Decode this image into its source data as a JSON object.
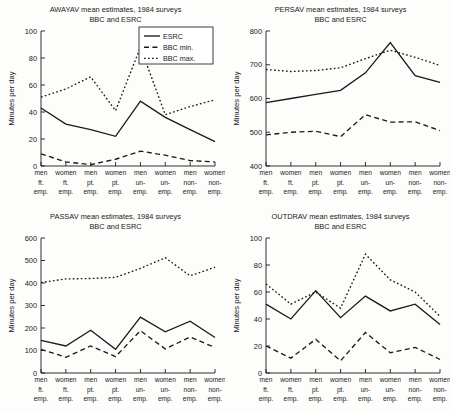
{
  "figure": {
    "width": 450,
    "height": 413,
    "background": "#fdfdfb",
    "ink_color": "#1a1a1a"
  },
  "shared": {
    "categories": [
      "men ft. emp.",
      "women ft. emp.",
      "men pt. emp.",
      "women pt. emp.",
      "men un- emp.",
      "women un- emp.",
      "men non- emp.",
      "women non- emp."
    ],
    "category_lines": [
      [
        "men",
        "ft.",
        "emp."
      ],
      [
        "women",
        "ft.",
        "emp."
      ],
      [
        "men",
        "pt.",
        "emp."
      ],
      [
        "women",
        "pt.",
        "emp."
      ],
      [
        "men",
        "un-",
        "emp."
      ],
      [
        "women",
        "un-",
        "emp."
      ],
      [
        "men",
        "non-",
        "emp."
      ],
      [
        "women",
        "non-",
        "emp."
      ]
    ],
    "ylabel": "Minutes per day",
    "title_line2": "BBC and ESRC",
    "legend": [
      {
        "label": "ESRC",
        "style": "solid"
      },
      {
        "label": "BBC min.",
        "style": "dashed"
      },
      {
        "label": "BBC max.",
        "style": "dotted"
      }
    ]
  },
  "chart_data": [
    {
      "id": "awayav",
      "type": "line",
      "title": "AWAYAV mean estimates, 1984 surveys",
      "subtitle": "BBC and ESRC",
      "xlabel": "",
      "ylabel": "Minutes per day",
      "ylim": [
        0,
        100
      ],
      "yticks": [
        0,
        20,
        40,
        60,
        80,
        100
      ],
      "grid": false,
      "legend_position": "top-right",
      "categories": [
        "men ft. emp.",
        "women ft. emp.",
        "men pt. emp.",
        "women pt. emp.",
        "men un- emp.",
        "women un- emp.",
        "men non- emp.",
        "women non- emp."
      ],
      "series": [
        {
          "name": "ESRC",
          "style": "solid",
          "values": [
            43,
            31,
            27,
            22,
            48,
            36,
            27,
            18
          ]
        },
        {
          "name": "BBC min.",
          "style": "dashed",
          "values": [
            9,
            3,
            1,
            5,
            11,
            8,
            4,
            3
          ]
        },
        {
          "name": "BBC max.",
          "style": "dotted",
          "values": [
            51,
            57,
            66,
            41,
            88,
            38,
            44,
            49
          ]
        }
      ]
    },
    {
      "id": "persav",
      "type": "line",
      "title": "PERSAV mean estimates, 1984 surveys",
      "subtitle": "BBC and ESRC",
      "xlabel": "",
      "ylabel": "Minutes per day",
      "ylim": [
        400,
        800
      ],
      "yticks": [
        400,
        500,
        600,
        700,
        800
      ],
      "grid": false,
      "legend_position": "none",
      "categories": [
        "men ft. emp.",
        "women ft. emp.",
        "men pt. emp.",
        "women pt. emp.",
        "men un- emp.",
        "women un- emp.",
        "men non- emp.",
        "women non- emp."
      ],
      "series": [
        {
          "name": "ESRC",
          "style": "solid",
          "values": [
            588,
            600,
            612,
            624,
            676,
            766,
            668,
            648
          ]
        },
        {
          "name": "BBC min.",
          "style": "dashed",
          "values": [
            492,
            500,
            503,
            487,
            552,
            530,
            531,
            505
          ]
        },
        {
          "name": "BBC max.",
          "style": "dotted",
          "values": [
            686,
            680,
            683,
            691,
            718,
            743,
            722,
            698
          ]
        }
      ]
    },
    {
      "id": "passav",
      "type": "line",
      "title": "PASSAV mean estimates, 1984 surveys",
      "subtitle": "BBC and ESRC",
      "xlabel": "",
      "ylabel": "Minutes per day",
      "ylim": [
        0,
        600
      ],
      "yticks": [
        0,
        100,
        200,
        300,
        400,
        500,
        600
      ],
      "grid": false,
      "legend_position": "none",
      "categories": [
        "men ft. emp.",
        "women ft. emp.",
        "men pt. emp.",
        "women pt. emp.",
        "men un- emp.",
        "women un- emp.",
        "men non- emp.",
        "women non- emp."
      ],
      "series": [
        {
          "name": "ESRC",
          "style": "solid",
          "values": [
            145,
            120,
            190,
            105,
            248,
            183,
            230,
            158
          ]
        },
        {
          "name": "BBC min.",
          "style": "dashed",
          "values": [
            105,
            70,
            120,
            73,
            188,
            107,
            160,
            113
          ]
        },
        {
          "name": "BBC max.",
          "style": "dotted",
          "values": [
            402,
            418,
            420,
            425,
            465,
            512,
            432,
            470
          ]
        }
      ]
    },
    {
      "id": "outdrav",
      "type": "line",
      "title": "OUTDRAV mean estimates, 1984 surveys",
      "subtitle": "BBC and ESRC",
      "xlabel": "",
      "ylabel": "Minutes per day",
      "ylim": [
        0,
        100
      ],
      "yticks": [
        0,
        20,
        40,
        60,
        80,
        100
      ],
      "grid": false,
      "legend_position": "none",
      "categories": [
        "men ft. emp.",
        "women ft. emp.",
        "men pt. emp.",
        "women pt. emp.",
        "men un- emp.",
        "women un- emp.",
        "men non- emp.",
        "women non- emp."
      ],
      "series": [
        {
          "name": "ESRC",
          "style": "solid",
          "values": [
            51,
            40,
            61,
            41,
            57,
            46,
            51,
            36
          ]
        },
        {
          "name": "BBC min.",
          "style": "dashed",
          "values": [
            20,
            11,
            25,
            9,
            30,
            15,
            19,
            10
          ]
        },
        {
          "name": "BBC max.",
          "style": "dotted",
          "values": [
            66,
            51,
            60,
            48,
            88,
            69,
            60,
            42
          ]
        }
      ]
    }
  ]
}
